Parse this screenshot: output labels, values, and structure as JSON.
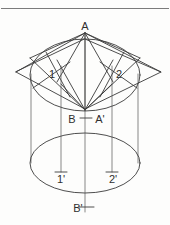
{
  "figure": {
    "background_color": "#fdfdfc",
    "line_color": "#3a3a3a",
    "thin_line_color": "#545454",
    "rule_color": "#7b7b7b",
    "text_color": "#2f2f2f"
  },
  "labels": {
    "apex": "A",
    "point_one": "1",
    "point_two": "2",
    "base_b": "B",
    "base_a_prime": "A'",
    "point_one_prime": "1'",
    "point_two_prime": "2'",
    "bottom_b_prime": "B'"
  },
  "geometry": {
    "top_rule": {
      "x1": 0,
      "y1": 8,
      "x2": 170,
      "y2": 8
    },
    "apex_point": {
      "x": 85,
      "y": 33
    },
    "convergence_point": {
      "x": 85,
      "y": 110
    },
    "upper_ellipse": {
      "cx": 85,
      "cy": 75,
      "rx": 55,
      "ry": 36
    },
    "lower_ellipse": {
      "cx": 85,
      "cy": 163,
      "rx": 55,
      "ry": 30
    },
    "rhombus_vertices": [
      {
        "x": 85,
        "y": 39
      },
      {
        "x": 161,
        "y": 72
      },
      {
        "x": 85,
        "y": 109
      },
      {
        "x": 16,
        "y": 72
      }
    ],
    "cylinder_left_edge_x": 31,
    "cylinder_right_edge_x": 138,
    "projector_one_x": 61,
    "projector_two_x": 112,
    "axis_x": 85
  },
  "label_positions": {
    "apex": {
      "x": 85,
      "y": 30
    },
    "point_one": {
      "x": 52,
      "y": 76
    },
    "point_two": {
      "x": 119,
      "y": 76
    },
    "base_b": {
      "x": 72,
      "y": 123
    },
    "base_a_prime": {
      "x": 97,
      "y": 123
    },
    "point_one_prime": {
      "x": 61,
      "y": 181
    },
    "point_two_prime": {
      "x": 113,
      "y": 181
    },
    "bottom_b_prime": {
      "x": 80,
      "y": 212
    }
  }
}
